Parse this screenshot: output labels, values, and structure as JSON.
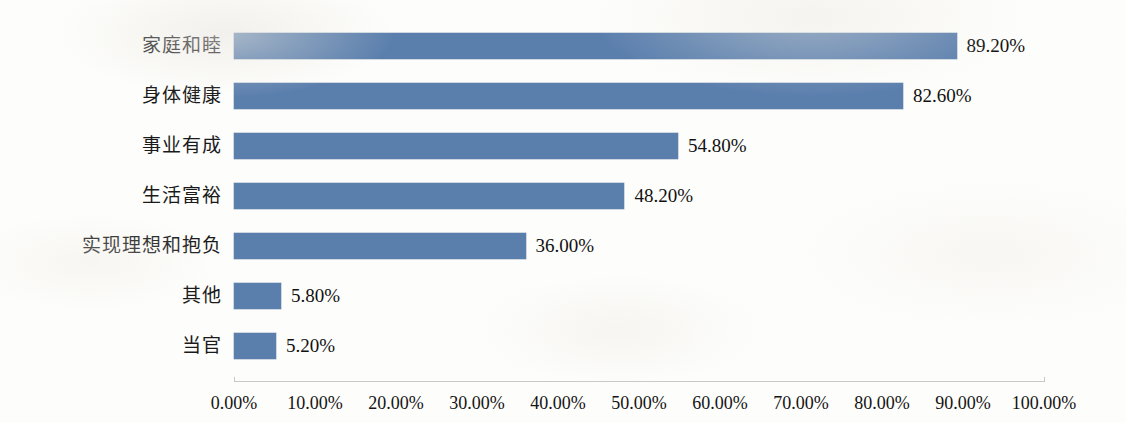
{
  "chart_data": {
    "type": "bar",
    "orientation": "horizontal",
    "title": "",
    "subtitle": "",
    "xlabel": "",
    "ylabel": "",
    "xlim": [
      0,
      100
    ],
    "grid": false,
    "legend": false,
    "value_format": "percent",
    "categories": [
      "家庭和睦",
      "身体健康",
      "事业有成",
      "生活富裕",
      "实现理想和抱负",
      "其他",
      "当官"
    ],
    "values": [
      89.2,
      82.6,
      54.8,
      48.2,
      36.0,
      5.8,
      5.2
    ],
    "data_labels": [
      "89.20%",
      "82.60%",
      "54.80%",
      "48.20%",
      "36.00%",
      "5.80%",
      "5.20%"
    ],
    "xticks": [
      0,
      10,
      20,
      30,
      40,
      50,
      60,
      70,
      80,
      90,
      100
    ],
    "xtick_labels": [
      "0.00%",
      "10.00%",
      "20.00%",
      "30.00%",
      "40.00%",
      "50.00%",
      "60.00%",
      "70.00%",
      "80.00%",
      "90.00%",
      "100.00%"
    ],
    "series": [
      {
        "name": "",
        "color": "#5b7fad",
        "values": [
          89.2,
          82.6,
          54.8,
          48.2,
          36.0,
          5.8,
          5.2
        ]
      }
    ]
  },
  "colors": {
    "bar": "#5b7fad",
    "axis": "#c9c9c4",
    "text": "#141414",
    "background": "#fdfdfb"
  }
}
